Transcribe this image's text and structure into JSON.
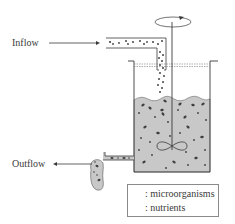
{
  "diagram": {
    "type": "bioreactor-schematic",
    "labels": {
      "inflow": "Inflow",
      "outflow": "Outflow"
    },
    "legend": {
      "items": [
        {
          "symbol": "microorganism-icon",
          "label": ": microorganisms"
        },
        {
          "symbol": "nutrient-icon",
          "label": ": nutrients"
        }
      ]
    },
    "colors": {
      "line": "#3a3a3a",
      "medium_fill": "#c8c8c8",
      "particle": "#444444",
      "background": "#ffffff"
    }
  }
}
